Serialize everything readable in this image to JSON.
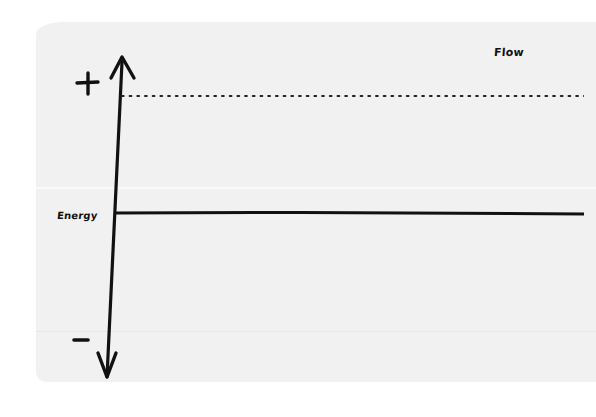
{
  "diagram": {
    "axis_labels": {
      "x": "Flow",
      "y": "Energy"
    },
    "signs": {
      "positive": "+",
      "negative": "−"
    },
    "lines": [
      {
        "name": "positive-threshold",
        "style": "dotted",
        "y": 96
      },
      {
        "name": "energy-baseline",
        "style": "solid",
        "y": 214
      }
    ],
    "colors": {
      "ink": "#111111",
      "paper": "#f1f1f1",
      "background": "#ffffff"
    }
  }
}
